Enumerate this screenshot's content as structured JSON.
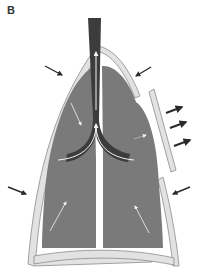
{
  "figure": {
    "panel_label": "B",
    "colors": {
      "background": "#ffffff",
      "lung": "#7a7a7a",
      "chest_wall_fill": "#e2e2e2",
      "chest_wall_stroke": "#8c8c8c",
      "airway": "#3c3c3c",
      "inner_arrows": "#f4f4f4",
      "outer_arrows": "#2a2a2a"
    },
    "elements": {
      "trachea": "dark airway with upward airflow arrow",
      "bronchi": "bifurcation with curved white airflow arrows",
      "chest_wall_left": "intact wall, inward arrows",
      "chest_wall_right_upper": "intact segment, inward arrow",
      "flail_segment": "detached segment moving outward, three outward arrows",
      "chest_wall_right_lower": "intact segment, inward arrow",
      "lung_arrows": "white arrows indicating lung movement"
    }
  }
}
